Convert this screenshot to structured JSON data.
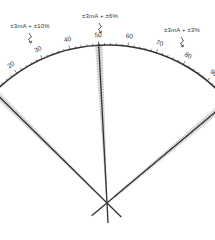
{
  "diagram": {
    "type": "meter-scale-accuracy",
    "scale": {
      "min": 0,
      "max": 100,
      "major_labels": [
        "0",
        "10",
        "20",
        "30",
        "40",
        "50",
        "60",
        "70",
        "80",
        "90",
        "100"
      ]
    },
    "tolerance_labels": [
      {
        "text": "±3mA + ±10%",
        "at_value": 10
      },
      {
        "text": "±3mA + ±6%",
        "at_value": 50
      },
      {
        "text": "±3mA + ±3%",
        "at_value": 100
      }
    ],
    "needles": [
      {
        "value": 10,
        "band": "±10%"
      },
      {
        "value": 50,
        "band": "±6%"
      },
      {
        "value": 100,
        "band": "±3%"
      }
    ],
    "colors": {
      "ink": "#333333",
      "hatch": "#555555",
      "background": "#ffffff"
    }
  }
}
